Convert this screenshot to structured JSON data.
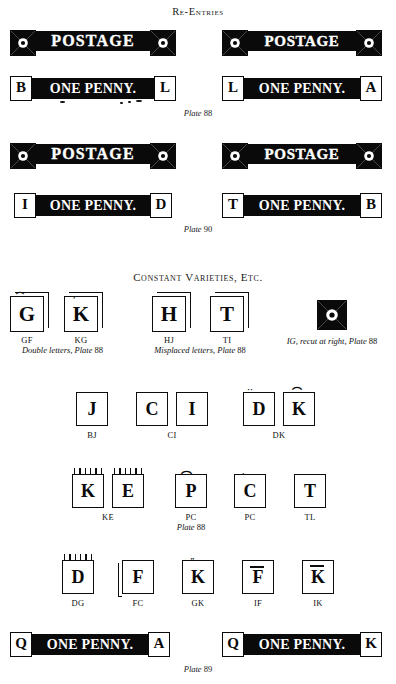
{
  "page": {
    "background": "#ffffff",
    "ink": "#0a0a0a"
  },
  "sections": {
    "reentries_title": "Re-Entries",
    "constant_title": "Constant Varieties, etc."
  },
  "reentries": {
    "plate88_caption_label": "Plate",
    "plate88_caption_number": "88",
    "plate90_caption_label": "Plate",
    "plate90_caption_number": "90",
    "rows": [
      {
        "postage_word": "POSTAGE",
        "penny_word": "ONE PENNY.",
        "left_letter": "B",
        "right_letter": "L"
      },
      {
        "postage_word": "POSTAGE",
        "penny_word": "ONE PENNY.",
        "left_letter": "L",
        "right_letter": "A"
      },
      {
        "postage_word": "POSTAGE",
        "penny_word": "ONE PENNY.",
        "left_letter": "I",
        "right_letter": "D"
      },
      {
        "postage_word": "POSTAGE",
        "penny_word": "ONE PENNY.",
        "left_letter": "T",
        "right_letter": "B"
      }
    ]
  },
  "varieties": {
    "row1": {
      "items": [
        {
          "glyph": "G",
          "label": "GF"
        },
        {
          "glyph": "K",
          "label": "KG"
        },
        {
          "glyph": "H",
          "label": "HJ"
        },
        {
          "glyph": "T",
          "label": "TI"
        }
      ],
      "caption_left_italic": "Double letters, Plate",
      "caption_left_number": "88",
      "caption_mid_italic": "Misplaced letters, Plate",
      "caption_mid_number": "88",
      "caption_right_italic": "IG, recut at right, Plate",
      "caption_right_number": "88",
      "ornament_name": "maltese-star-ornament"
    },
    "row2": {
      "items": [
        {
          "glyph": "J",
          "label": "BJ"
        },
        {
          "glyph": "C",
          "label": "CI"
        },
        {
          "glyph": "I",
          "label": ""
        },
        {
          "glyph": "D",
          "label": "DK"
        },
        {
          "glyph": "K",
          "label": ""
        }
      ]
    },
    "row3": {
      "items": [
        {
          "glyph": "K",
          "label": "KE"
        },
        {
          "glyph": "E",
          "label": ""
        },
        {
          "glyph": "P",
          "label": "PA"
        },
        {
          "glyph": "C",
          "label": "PC"
        },
        {
          "glyph": "T",
          "label": "TL"
        }
      ],
      "caption_italic": "Plate",
      "caption_number": "88"
    },
    "row4": {
      "items": [
        {
          "glyph": "D",
          "label": "DG"
        },
        {
          "glyph": "F",
          "label": "FC"
        },
        {
          "glyph": "K",
          "label": "GK"
        },
        {
          "glyph": "F",
          "label": "IF"
        },
        {
          "glyph": "K",
          "label": "IK"
        }
      ]
    }
  },
  "bottom": {
    "strips": [
      {
        "penny_word": "ONE PENNY.",
        "left_letter": "Q",
        "right_letter": "A"
      },
      {
        "penny_word": "ONE PENNY.",
        "left_letter": "Q",
        "right_letter": "K"
      }
    ],
    "caption_label": "Plate",
    "caption_number": "89"
  }
}
